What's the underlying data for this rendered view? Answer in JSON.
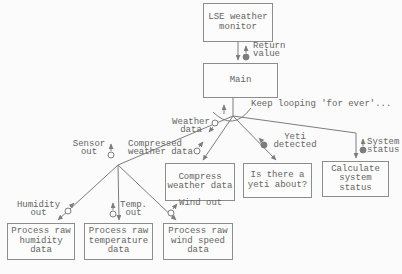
{
  "diagram_type": "structure-chart",
  "colors": {
    "background": "#fbfbfb",
    "ink": "#7d7d7d",
    "text": "#646464",
    "box_border": "#8c8c8c"
  },
  "nodes": {
    "lse": {
      "lines": [
        "LSE weather",
        "monitor"
      ]
    },
    "main": {
      "lines": [
        "Main"
      ]
    },
    "compress": {
      "lines": [
        "Compress",
        "weather data"
      ]
    },
    "yeti": {
      "lines": [
        "Is there a",
        "yeti about?"
      ]
    },
    "calc": {
      "lines": [
        "Calculate",
        "system",
        "status"
      ]
    },
    "humidity": {
      "lines": [
        "Process raw",
        "humidity",
        "data"
      ]
    },
    "temperature": {
      "lines": [
        "Process raw",
        "temperature",
        "data"
      ]
    },
    "wind": {
      "lines": [
        "Process raw",
        "wind speed",
        "data"
      ]
    }
  },
  "labels": {
    "return_value": {
      "lines": [
        "Return",
        "value"
      ]
    },
    "keep_looping": {
      "lines": [
        "Keep looping 'for ever'..."
      ]
    },
    "weather_data": {
      "lines": [
        "Weather",
        "data"
      ]
    },
    "compressed_weather_data": {
      "lines": [
        "Compressed",
        "weather data"
      ]
    },
    "sensor_out": {
      "lines": [
        "Sensor",
        "out"
      ]
    },
    "yeti_detected": {
      "lines": [
        "Yeti",
        "detected"
      ]
    },
    "system_status": {
      "lines": [
        "System",
        "status"
      ]
    },
    "humidity_out": {
      "lines": [
        "Humidity",
        "out"
      ]
    },
    "temp_out": {
      "lines": [
        "Temp.",
        "out"
      ]
    },
    "wind_out": {
      "lines": [
        "Wind out"
      ]
    }
  },
  "couples": {
    "return_value": "control-filled-circle-arrow-up",
    "sensor_out": "data-open-circle-arrow-up",
    "weather_data": "data-open-circle-arrow-down-left",
    "compressed_weather_data": "data-open-circle-arrow-up-right",
    "yeti_detected": "control-filled-circle-arrow-up-left",
    "system_status": "control-filled-circle-arrow-up",
    "humidity_out": "data-open-circle-arrow-up-right",
    "temp_out": "data-open-circle-arrow-up",
    "wind_out": "data-open-circle-arrow-up-right"
  }
}
